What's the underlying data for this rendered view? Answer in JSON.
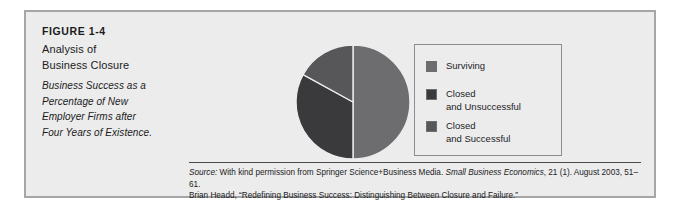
{
  "figure": {
    "number_label": "FIGURE 1-4",
    "title_lines": [
      "Analysis of",
      "Business Closure"
    ],
    "subtitle_lines": [
      "Business Success as a",
      "Percentage of New",
      "Employer Firms after",
      "Four Years of Existence."
    ]
  },
  "legend": {
    "items": [
      {
        "label": "Surviving",
        "color": "#6d6d6f"
      },
      {
        "label": "Closed\nand Unsuccessful",
        "color": "#3a3a3c"
      },
      {
        "label": "Closed\nand Successful",
        "color": "#575759"
      }
    ]
  },
  "source": {
    "prefix": "Source:",
    "line1_part1": " With kind permission from Springer Science+Business Media. ",
    "line1_journal": "Small Business Economics",
    "line1_part2": ", 21 (1). August 2003, 51–61.",
    "line2": "Brian Headd, “Redefining Business Success: Distinguishing Between Closure and Failure.”"
  },
  "chart_data": {
    "type": "pie",
    "title": "Analysis of Business Closure",
    "subtitle": "Business Success as a Percentage of New Employer Firms after Four Years of Existence.",
    "labels": [
      "Surviving",
      "Closed and Unsuccessful",
      "Closed and Successful"
    ],
    "values": [
      50,
      33,
      17
    ],
    "unit": "percent",
    "colors": [
      "#6d6d6f",
      "#3a3a3c",
      "#575759"
    ],
    "legend_position": "right",
    "start_angle_deg": 0,
    "direction": "clockwise",
    "grid": false,
    "xlabel": "",
    "ylabel": ""
  }
}
